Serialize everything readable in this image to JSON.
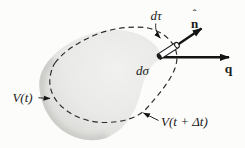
{
  "figure": {
    "background": "#fcfcfb",
    "ink": "#1a1a1a",
    "dashed_ink": "#2a2a2a",
    "blob_inner": "#f1f1ef",
    "blob_mid": "#e9e9e7",
    "blob_edge": "#d7d7d4",
    "blob_rim_shadow": "#c8c8c5",
    "labels": {
      "v_t": "V(t)",
      "v_t_dt": "V(t + Δt)",
      "d_tau": "dτ",
      "d_sigma": "dσ",
      "n_hat_accent": "ˆ",
      "n_hat": "n",
      "q": "q"
    }
  }
}
